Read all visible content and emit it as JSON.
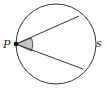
{
  "diagram": {
    "labels": {
      "point": "P",
      "arc": "s"
    },
    "colors": {
      "stroke": "#333333",
      "angle_fill": "#c8c8c8",
      "point": "#111111"
    }
  }
}
